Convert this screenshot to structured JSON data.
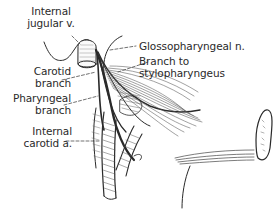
{
  "figure": {
    "labels": {
      "internal_jugular": [
        "Internal",
        "jugular v."
      ],
      "carotid_branch": [
        "Carotid",
        "branch"
      ],
      "pharyngeal_branch": [
        "Pharyngeal",
        "branch"
      ],
      "internal_carotid": [
        "Internal",
        "carotid a."
      ],
      "glossopharyngeal": [
        "Glossopharyngeal n."
      ],
      "branch_to_stylopharyngeus": [
        "Branch to",
        "stylopharyngeus"
      ]
    },
    "colors": {
      "ink": "#2a2a2a",
      "background": "#ffffff"
    }
  }
}
